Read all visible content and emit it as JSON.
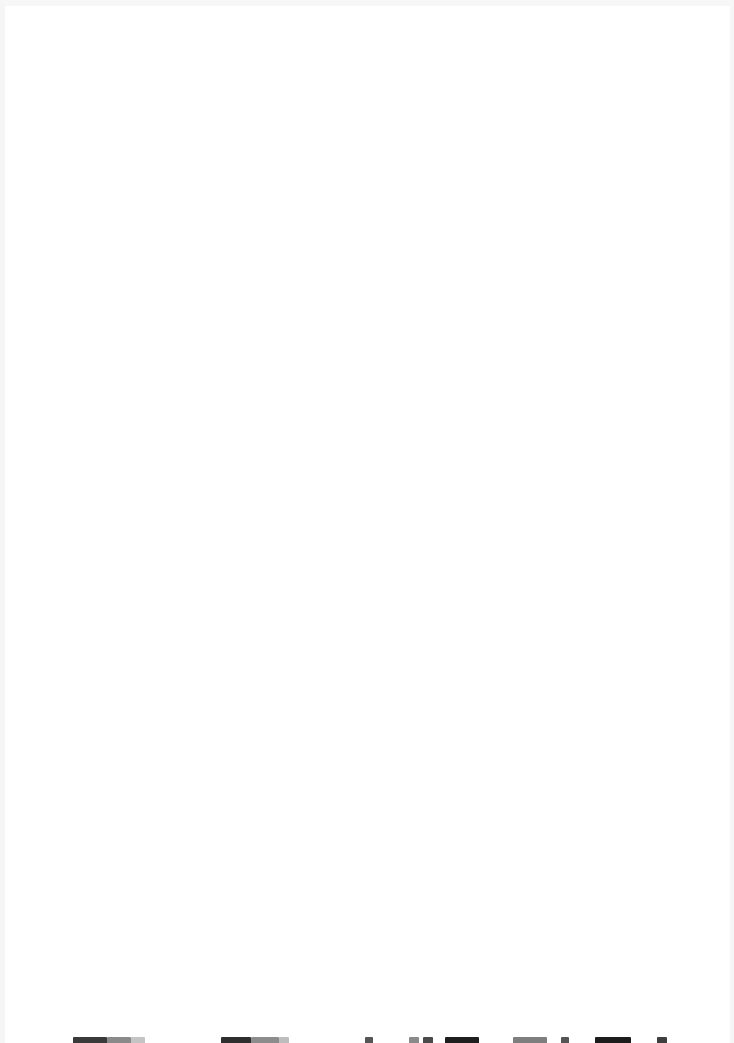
{
  "page": {
    "background_color": "#ffffff",
    "border_color": "#f5f5f5",
    "content_visible": false
  },
  "clipped_text_line": {
    "note_visible_text": "",
    "fragments": [
      {
        "left": 68,
        "width": 34,
        "color": "#3a3a3a"
      },
      {
        "left": 102,
        "width": 24,
        "color": "#8a8a8a"
      },
      {
        "left": 126,
        "width": 14,
        "color": "#c4c4c4"
      },
      {
        "left": 216,
        "width": 30,
        "color": "#2e2e2e"
      },
      {
        "left": 246,
        "width": 28,
        "color": "#8c8c8c"
      },
      {
        "left": 274,
        "width": 10,
        "color": "#bdbdbd"
      },
      {
        "left": 360,
        "width": 8,
        "color": "#555555"
      },
      {
        "left": 404,
        "width": 10,
        "color": "#8a8a8a"
      },
      {
        "left": 418,
        "width": 10,
        "color": "#4a4a4a"
      },
      {
        "left": 440,
        "width": 34,
        "color": "#1e1e1e"
      },
      {
        "left": 508,
        "width": 34,
        "color": "#7e7e7e"
      },
      {
        "left": 556,
        "width": 8,
        "color": "#555555"
      },
      {
        "left": 590,
        "width": 36,
        "color": "#1c1c1c"
      },
      {
        "left": 652,
        "width": 10,
        "color": "#3f3f3f"
      }
    ]
  }
}
